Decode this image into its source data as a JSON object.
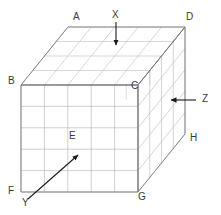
{
  "figure": {
    "type": "3d-grid-cuboid-diagram",
    "background": "#ffffff",
    "colors": {
      "outline": "#6e6e6e",
      "grid": "#b3b3b3",
      "grid_faint": "#cccccc",
      "hidden_dotted": "#d4d4d4",
      "arrow": "#1a1a1a",
      "label_text": "#3a3a3a"
    },
    "dimensions": {
      "width_cells": 5,
      "height_cells": 5,
      "depth_cells": 4
    }
  },
  "vertex_labels": [
    {
      "id": "A",
      "text": "A",
      "x": 73,
      "y": 12
    },
    {
      "id": "B",
      "text": "B",
      "x": 8,
      "y": 76
    },
    {
      "id": "C",
      "text": "C",
      "x": 131,
      "y": 81
    },
    {
      "id": "D",
      "text": "D",
      "x": 186,
      "y": 12
    },
    {
      "id": "E",
      "text": "E",
      "x": 69,
      "y": 131
    },
    {
      "id": "F",
      "text": "F",
      "x": 8,
      "y": 186
    },
    {
      "id": "G",
      "text": "G",
      "x": 138,
      "y": 192
    },
    {
      "id": "H",
      "text": "H",
      "x": 190,
      "y": 133
    }
  ],
  "arrow_labels": [
    {
      "id": "X",
      "text": "X",
      "x": 112,
      "y": 10,
      "direction": "down"
    },
    {
      "id": "Y",
      "text": "Y",
      "x": 22,
      "y": 198,
      "direction": "up-right"
    },
    {
      "id": "Z",
      "text": "Z",
      "x": 202,
      "y": 94,
      "direction": "left"
    }
  ],
  "arrows": [
    {
      "id": "arrow-x",
      "name": "x-arrow",
      "x1": 116,
      "y1": 22,
      "x2": 116,
      "y2": 46
    },
    {
      "id": "arrow-z",
      "name": "z-arrow",
      "x1": 196,
      "y1": 100,
      "x2": 170,
      "y2": 100
    },
    {
      "id": "arrow-y",
      "name": "y-arrow",
      "x1": 28,
      "y1": 199,
      "x2": 79,
      "y2": 154
    }
  ],
  "geometry": {
    "front_face": {
      "bl": [
        21,
        192
      ],
      "br": [
        138,
        192
      ],
      "tr": [
        138,
        85
      ],
      "tl": [
        21,
        85
      ]
    },
    "depth_vector": [
      47,
      -58
    ],
    "top_face": {
      "near_left": [
        21,
        85
      ],
      "near_right": [
        138,
        85
      ],
      "far_right": [
        185,
        27
      ],
      "far_left": [
        68,
        27
      ]
    },
    "right_face": {
      "near_top": [
        138,
        85
      ],
      "far_top": [
        185,
        27
      ],
      "far_bottom": [
        185,
        134
      ],
      "near_bottom": [
        138,
        192
      ]
    }
  }
}
